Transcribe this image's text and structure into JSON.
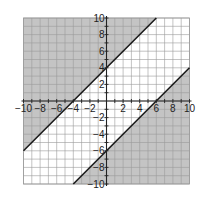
{
  "chart_data": {
    "type": "line",
    "title": "",
    "xlabel": "",
    "ylabel": "",
    "xlim": [
      -10,
      10
    ],
    "ylim": [
      -10,
      10
    ],
    "grid": true,
    "grid_step": 1,
    "x_tick_labels": [
      "-10",
      "-8",
      "-6",
      "-4",
      "-2",
      "2",
      "4",
      "6",
      "8",
      "10"
    ],
    "y_tick_labels": [
      "10",
      "8",
      "6",
      "4",
      "2",
      "-2",
      "-4",
      "-6",
      "-8",
      "-10"
    ],
    "x_ticks": [
      -10,
      -8,
      -6,
      -4,
      -2,
      2,
      4,
      6,
      8,
      10
    ],
    "y_ticks": [
      10,
      8,
      6,
      4,
      2,
      -2,
      -4,
      -6,
      -8,
      -10
    ],
    "series": [
      {
        "name": "boundary y = x + 4",
        "equation": "y = x + 4",
        "x": [
          -10,
          6
        ],
        "y": [
          -6,
          10
        ],
        "style": "solid",
        "shaded": "above"
      },
      {
        "name": "boundary y = x - 6",
        "equation": "y = x - 6",
        "x": [
          -4,
          10
        ],
        "y": [
          -10,
          4
        ],
        "style": "solid",
        "shaded": "below"
      }
    ],
    "shaded_regions": [
      {
        "description": "y >= x + 4",
        "polygon": [
          [
            -10,
            -6
          ],
          [
            6,
            10
          ],
          [
            -10,
            10
          ]
        ]
      },
      {
        "description": "y <= x - 6",
        "polygon": [
          [
            -4,
            -10
          ],
          [
            10,
            4
          ],
          [
            10,
            -10
          ]
        ]
      }
    ],
    "colors": {
      "shade": "#c4c4c4",
      "grid": "#9a9a9a",
      "axis": "#222222",
      "boundary": "#1a1a1a"
    }
  }
}
